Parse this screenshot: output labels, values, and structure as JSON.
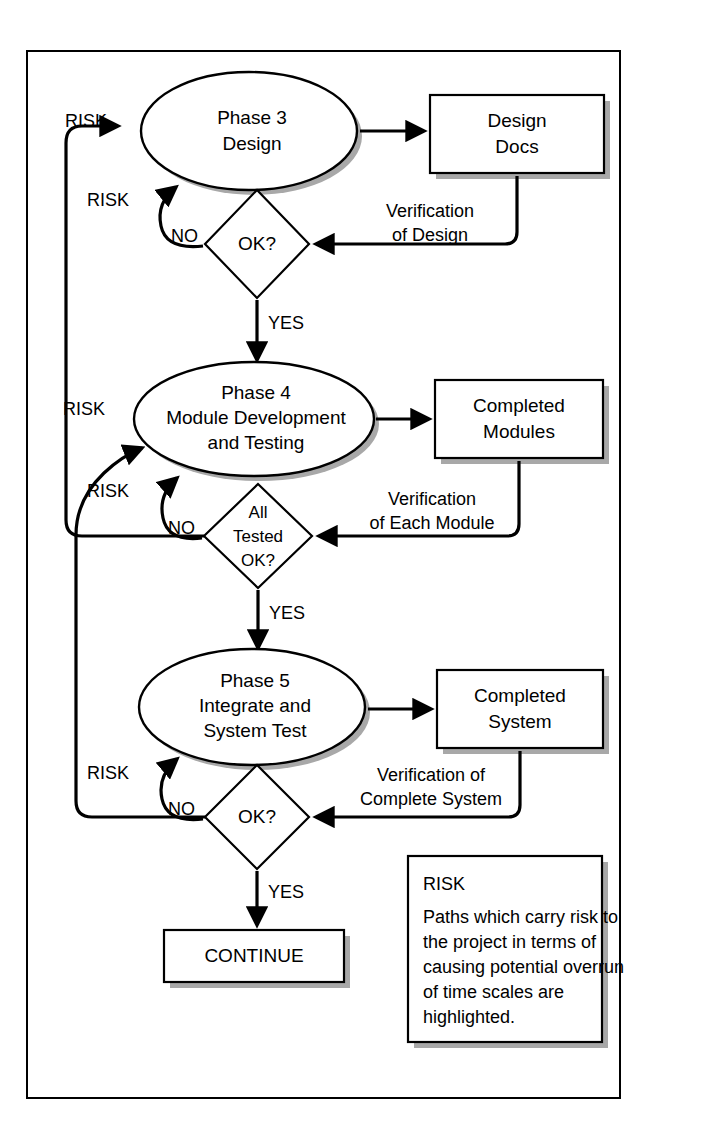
{
  "diagram": {
    "colors": {
      "line": "#000000",
      "shadow": "#a8a8a8",
      "fill": "#ffffff",
      "frame": "#000000"
    }
  },
  "nodes": {
    "phase3": {
      "line1": "Phase 3",
      "line2": "Design"
    },
    "design_docs": {
      "line1": "Design",
      "line2": "Docs"
    },
    "decision1": {
      "line1": "OK?"
    },
    "phase4": {
      "line1": "Phase 4",
      "line2": "Module Development",
      "line3": "and Testing"
    },
    "completed_modules": {
      "line1": "Completed",
      "line2": "Modules"
    },
    "decision2": {
      "line1": "All",
      "line2": "Tested",
      "line3": "OK?"
    },
    "phase5": {
      "line1": "Phase 5",
      "line2": "Integrate and",
      "line3": "System Test"
    },
    "completed_system": {
      "line1": "Completed",
      "line2": "System"
    },
    "decision3": {
      "line1": "OK?"
    },
    "continue": {
      "line1": "CONTINUE"
    }
  },
  "edge_labels": {
    "risk_to_phase3_outer": "RISK",
    "risk_to_phase3_inner": "RISK",
    "no_decision1": "NO",
    "yes_decision1": "YES",
    "verification_of_design_line1": "Verification",
    "verification_of_design_line2": "of Design",
    "risk_to_phase4_outer": "RISK",
    "risk_to_phase4_inner": "RISK",
    "no_decision2": "NO",
    "yes_decision2": "YES",
    "verification_each_module_line1": "Verification",
    "verification_each_module_line2": "of Each Module",
    "risk_to_phase5": "RISK",
    "no_decision3": "NO",
    "yes_decision3": "YES",
    "verification_complete_system_line1": "Verification of",
    "verification_complete_system_line2": "Complete System"
  },
  "legend": {
    "title": "RISK",
    "body_line1": "Paths which carry risk to",
    "body_line2": "the project in terms of",
    "body_line3": "causing potential overrun",
    "body_line4": "of time scales are",
    "body_line5": "highlighted."
  }
}
